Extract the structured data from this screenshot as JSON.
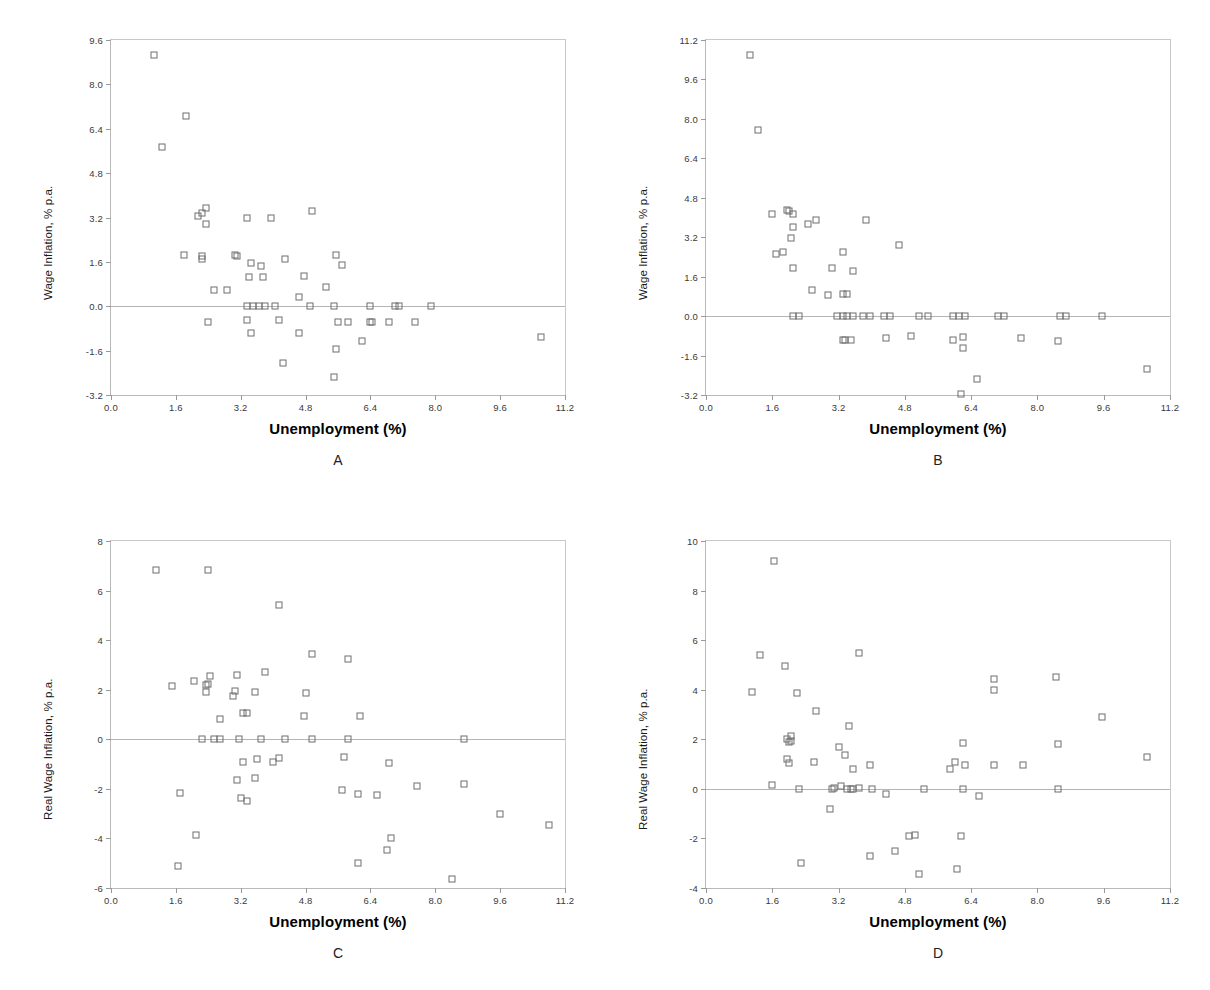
{
  "figure": {
    "background": "#ffffff",
    "marker_color": "#6e6e6e",
    "axis_color": "#b9b9b9",
    "width": 1210,
    "height": 990
  },
  "panels": [
    {
      "id": "A",
      "letter": "A",
      "xlabel": "Unemployment (%)",
      "ylabel": "Wage Inflation, % p.a."
    },
    {
      "id": "B",
      "letter": "B",
      "xlabel": "Unemployment (%)",
      "ylabel": "Wage Inflation, % p.a."
    },
    {
      "id": "C",
      "letter": "C",
      "xlabel": "Unemployment (%)",
      "ylabel": "Real Wage Inflation, % p.a."
    },
    {
      "id": "D",
      "letter": "D",
      "xlabel": "Unemployment (%)",
      "ylabel": "Real Wage Inflation, % p.a."
    }
  ],
  "chart_data": [
    {
      "panel": "A",
      "type": "scatter",
      "title": "A",
      "xlabel": "Unemployment (%)",
      "ylabel": "Wage Inflation, % p.a.",
      "xlim": [
        0.0,
        11.2
      ],
      "ylim": [
        -3.2,
        9.6
      ],
      "xticks": [
        "0.0",
        "1.6",
        "3.2",
        "4.8",
        "6.4",
        "8.0",
        "9.6",
        "11.2"
      ],
      "yticks": [
        "-3.2",
        "-1.6",
        "0.0",
        "1.6",
        "3.2",
        "4.8",
        "6.4",
        "8.0",
        "9.6"
      ],
      "grid": false,
      "legend": "none",
      "points": [
        [
          1.05,
          9.05
        ],
        [
          1.85,
          6.85
        ],
        [
          1.25,
          5.75
        ],
        [
          2.15,
          3.25
        ],
        [
          2.25,
          3.35
        ],
        [
          2.35,
          3.55
        ],
        [
          2.35,
          2.95
        ],
        [
          3.35,
          3.2
        ],
        [
          3.95,
          3.2
        ],
        [
          4.95,
          3.45
        ],
        [
          1.8,
          1.85
        ],
        [
          2.25,
          1.8
        ],
        [
          2.25,
          1.7
        ],
        [
          3.05,
          1.85
        ],
        [
          3.1,
          1.8
        ],
        [
          3.45,
          1.55
        ],
        [
          3.7,
          1.45
        ],
        [
          4.3,
          1.7
        ],
        [
          5.55,
          1.85
        ],
        [
          5.7,
          1.5
        ],
        [
          3.4,
          1.05
        ],
        [
          3.75,
          1.05
        ],
        [
          4.75,
          1.1
        ],
        [
          2.55,
          0.6
        ],
        [
          2.85,
          0.6
        ],
        [
          5.3,
          0.7
        ],
        [
          4.65,
          0.35
        ],
        [
          3.35,
          0.0
        ],
        [
          3.5,
          0.0
        ],
        [
          3.65,
          0.0
        ],
        [
          3.8,
          0.0
        ],
        [
          4.05,
          0.0
        ],
        [
          4.9,
          0.0
        ],
        [
          5.5,
          0.0
        ],
        [
          6.4,
          0.0
        ],
        [
          7.0,
          0.0
        ],
        [
          7.1,
          0.0
        ],
        [
          7.9,
          0.0
        ],
        [
          2.4,
          -0.55
        ],
        [
          3.35,
          -0.5
        ],
        [
          4.15,
          -0.5
        ],
        [
          5.6,
          -0.55
        ],
        [
          5.85,
          -0.55
        ],
        [
          6.4,
          -0.55
        ],
        [
          6.45,
          -0.55
        ],
        [
          6.85,
          -0.55
        ],
        [
          7.5,
          -0.55
        ],
        [
          3.45,
          -0.95
        ],
        [
          4.65,
          -0.95
        ],
        [
          6.2,
          -1.25
        ],
        [
          10.6,
          -1.1
        ],
        [
          5.55,
          -1.55
        ],
        [
          4.25,
          -2.05
        ],
        [
          5.5,
          -2.55
        ]
      ]
    },
    {
      "panel": "B",
      "type": "scatter",
      "title": "B",
      "xlabel": "Unemployment (%)",
      "ylabel": "Wage Inflation, % p.a.",
      "xlim": [
        0.0,
        11.2
      ],
      "ylim": [
        -3.2,
        11.2
      ],
      "xticks": [
        "0.0",
        "1.6",
        "3.2",
        "4.8",
        "6.4",
        "8.0",
        "9.6",
        "11.2"
      ],
      "yticks": [
        "-3.2",
        "-1.6",
        "0.0",
        "1.6",
        "3.2",
        "4.8",
        "6.4",
        "8.0",
        "9.6",
        "11.2"
      ],
      "grid": false,
      "legend": "none",
      "points": [
        [
          1.05,
          10.6
        ],
        [
          1.25,
          7.55
        ],
        [
          1.6,
          4.15
        ],
        [
          1.95,
          4.3
        ],
        [
          2.0,
          4.25
        ],
        [
          2.1,
          4.15
        ],
        [
          2.1,
          3.6
        ],
        [
          2.45,
          3.75
        ],
        [
          2.65,
          3.9
        ],
        [
          3.85,
          3.9
        ],
        [
          2.05,
          3.15
        ],
        [
          1.7,
          2.5
        ],
        [
          1.85,
          2.6
        ],
        [
          4.65,
          2.9
        ],
        [
          3.3,
          2.6
        ],
        [
          2.1,
          1.95
        ],
        [
          3.05,
          1.95
        ],
        [
          3.55,
          1.85
        ],
        [
          2.55,
          1.05
        ],
        [
          2.95,
          0.85
        ],
        [
          3.3,
          0.9
        ],
        [
          3.4,
          0.9
        ],
        [
          2.1,
          0.0
        ],
        [
          2.25,
          0.0
        ],
        [
          3.15,
          0.0
        ],
        [
          3.3,
          0.0
        ],
        [
          3.4,
          0.0
        ],
        [
          3.55,
          0.0
        ],
        [
          3.8,
          0.0
        ],
        [
          3.95,
          0.0
        ],
        [
          4.3,
          0.0
        ],
        [
          4.45,
          0.0
        ],
        [
          5.15,
          0.0
        ],
        [
          5.35,
          0.0
        ],
        [
          5.95,
          0.0
        ],
        [
          6.1,
          0.0
        ],
        [
          6.25,
          0.0
        ],
        [
          7.05,
          0.0
        ],
        [
          7.2,
          0.0
        ],
        [
          8.55,
          0.0
        ],
        [
          8.7,
          0.0
        ],
        [
          9.55,
          0.0
        ],
        [
          3.3,
          -0.95
        ],
        [
          3.35,
          -0.95
        ],
        [
          3.5,
          -0.95
        ],
        [
          4.35,
          -0.9
        ],
        [
          4.95,
          -0.8
        ],
        [
          5.95,
          -0.95
        ],
        [
          6.2,
          -0.85
        ],
        [
          6.2,
          -1.3
        ],
        [
          7.6,
          -0.9
        ],
        [
          8.5,
          -1.0
        ],
        [
          6.55,
          -2.55
        ],
        [
          6.15,
          -3.15
        ],
        [
          10.65,
          -2.15
        ]
      ]
    },
    {
      "panel": "C",
      "type": "scatter",
      "title": "C",
      "xlabel": "Unemployment (%)",
      "ylabel": "Real Wage Inflation, % p.a.",
      "xlim": [
        0.0,
        11.2
      ],
      "ylim": [
        -6,
        8
      ],
      "xticks": [
        "0.0",
        "1.6",
        "3.2",
        "4.8",
        "6.4",
        "8.0",
        "9.6",
        "11.2"
      ],
      "yticks": [
        "-6",
        "-4",
        "-2",
        "0",
        "2",
        "4",
        "6",
        "8"
      ],
      "grid": false,
      "legend": "none",
      "points": [
        [
          1.1,
          6.85
        ],
        [
          2.4,
          6.85
        ],
        [
          4.15,
          5.4
        ],
        [
          4.95,
          3.45
        ],
        [
          5.85,
          3.25
        ],
        [
          2.45,
          2.55
        ],
        [
          3.1,
          2.6
        ],
        [
          3.8,
          2.7
        ],
        [
          2.05,
          2.35
        ],
        [
          2.35,
          2.2
        ],
        [
          2.4,
          2.25
        ],
        [
          1.5,
          2.15
        ],
        [
          3.05,
          1.95
        ],
        [
          2.35,
          1.9
        ],
        [
          3.55,
          1.9
        ],
        [
          4.8,
          1.85
        ],
        [
          3.0,
          1.75
        ],
        [
          2.7,
          0.8
        ],
        [
          3.25,
          1.05
        ],
        [
          3.35,
          1.05
        ],
        [
          4.75,
          0.95
        ],
        [
          6.15,
          0.95
        ],
        [
          2.25,
          0.0
        ],
        [
          2.55,
          0.0
        ],
        [
          2.7,
          0.0
        ],
        [
          3.15,
          0.0
        ],
        [
          3.7,
          0.0
        ],
        [
          4.3,
          0.0
        ],
        [
          4.95,
          0.0
        ],
        [
          5.85,
          0.0
        ],
        [
          8.7,
          0.0
        ],
        [
          3.25,
          -0.9
        ],
        [
          3.6,
          -0.8
        ],
        [
          4.0,
          -0.9
        ],
        [
          4.15,
          -0.75
        ],
        [
          5.75,
          -0.7
        ],
        [
          6.85,
          -0.95
        ],
        [
          3.1,
          -1.65
        ],
        [
          3.55,
          -1.55
        ],
        [
          7.55,
          -1.9
        ],
        [
          8.7,
          -1.8
        ],
        [
          1.7,
          -2.15
        ],
        [
          5.7,
          -2.05
        ],
        [
          6.1,
          -2.2
        ],
        [
          6.55,
          -2.25
        ],
        [
          3.2,
          -2.35
        ],
        [
          3.35,
          -2.5
        ],
        [
          9.6,
          -3.0
        ],
        [
          10.8,
          -3.45
        ],
        [
          2.1,
          -3.85
        ],
        [
          6.9,
          -4.0
        ],
        [
          6.8,
          -4.45
        ],
        [
          1.65,
          -5.1
        ],
        [
          6.1,
          -5.0
        ],
        [
          8.4,
          -5.65
        ]
      ]
    },
    {
      "panel": "D",
      "type": "scatter",
      "title": "D",
      "xlabel": "Unemployment (%)",
      "ylabel": "Real Wage Inflation, % p.a.",
      "xlim": [
        0.0,
        11.2
      ],
      "ylim": [
        -4,
        10
      ],
      "xticks": [
        "0.0",
        "1.6",
        "3.2",
        "4.8",
        "6.4",
        "8.0",
        "9.6",
        "11.2"
      ],
      "yticks": [
        "-4",
        "-2",
        "0",
        "2",
        "4",
        "6",
        "8",
        "10"
      ],
      "grid": false,
      "legend": "none",
      "points": [
        [
          1.65,
          9.2
        ],
        [
          1.3,
          5.4
        ],
        [
          3.7,
          5.5
        ],
        [
          1.9,
          4.95
        ],
        [
          6.95,
          4.45
        ],
        [
          8.45,
          4.5
        ],
        [
          1.1,
          3.9
        ],
        [
          2.2,
          3.85
        ],
        [
          6.95,
          4.0
        ],
        [
          2.65,
          3.15
        ],
        [
          9.55,
          2.9
        ],
        [
          3.45,
          2.55
        ],
        [
          2.05,
          2.15
        ],
        [
          1.95,
          2.0
        ],
        [
          2.05,
          1.95
        ],
        [
          2.0,
          1.9
        ],
        [
          6.2,
          1.85
        ],
        [
          8.5,
          1.8
        ],
        [
          3.2,
          1.7
        ],
        [
          3.35,
          1.35
        ],
        [
          10.65,
          1.3
        ],
        [
          1.95,
          1.2
        ],
        [
          2.0,
          1.05
        ],
        [
          2.6,
          1.1
        ],
        [
          6.0,
          1.1
        ],
        [
          5.9,
          0.8
        ],
        [
          6.25,
          0.95
        ],
        [
          6.95,
          0.95
        ],
        [
          7.65,
          0.95
        ],
        [
          3.95,
          0.95
        ],
        [
          3.55,
          0.8
        ],
        [
          1.6,
          0.15
        ],
        [
          3.1,
          0.05
        ],
        [
          3.25,
          0.1
        ],
        [
          3.4,
          0.0
        ],
        [
          3.5,
          0.0
        ],
        [
          3.55,
          0.0
        ],
        [
          2.25,
          0.0
        ],
        [
          3.05,
          0.0
        ],
        [
          3.7,
          0.05
        ],
        [
          4.0,
          0.0
        ],
        [
          5.25,
          0.0
        ],
        [
          6.2,
          0.0
        ],
        [
          8.5,
          0.0
        ],
        [
          4.35,
          -0.2
        ],
        [
          6.6,
          -0.3
        ],
        [
          3.0,
          -0.8
        ],
        [
          4.9,
          -1.9
        ],
        [
          5.05,
          -1.85
        ],
        [
          6.15,
          -1.9
        ],
        [
          4.55,
          -2.5
        ],
        [
          3.95,
          -2.7
        ],
        [
          2.3,
          -3.0
        ],
        [
          6.05,
          -3.25
        ],
        [
          5.15,
          -3.45
        ]
      ]
    }
  ]
}
